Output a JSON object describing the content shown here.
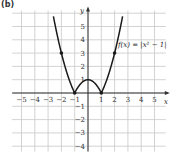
{
  "part_label": "(b)",
  "chart_data": {
    "type": "line",
    "title": "",
    "function_label": "f(x) = |x² − 1|",
    "xlabel": "x",
    "ylabel": "y",
    "xlim": [
      -6,
      6
    ],
    "ylim": [
      -4.4,
      6.2
    ],
    "grid": true,
    "x_ticks": [
      -5,
      -4,
      -3,
      -2,
      -1,
      1,
      2,
      3,
      4,
      5
    ],
    "x_tick_labels": [
      "−5",
      "−4",
      "−3",
      "−2",
      "−1",
      "1",
      "2",
      "3",
      "4",
      "5"
    ],
    "y_ticks": [
      -4,
      -3,
      -2,
      -1,
      1,
      2,
      3,
      4,
      5
    ],
    "y_tick_labels": [
      "−4",
      "−3",
      "−2",
      "−1",
      "1",
      "2",
      "3",
      "4",
      "5"
    ],
    "series": [
      {
        "name": "f(x) = |x² − 1|",
        "x": [
          -2.6,
          -2,
          -1,
          0,
          1,
          2,
          2.6
        ],
        "y": [
          5.76,
          3,
          0,
          1,
          0,
          3,
          5.76
        ]
      }
    ],
    "marked_points": [
      {
        "x": -2,
        "y": 3
      },
      {
        "x": -1,
        "y": 0
      },
      {
        "x": 0,
        "y": 1
      },
      {
        "x": 1,
        "y": 0
      },
      {
        "x": 2,
        "y": 3
      }
    ]
  }
}
